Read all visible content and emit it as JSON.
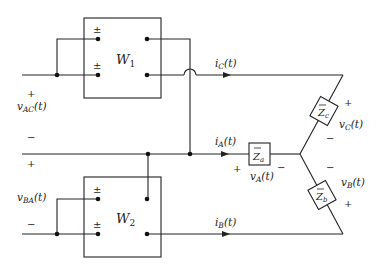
{
  "diagram": {
    "type": "circuit",
    "wattmeters": [
      {
        "id": "W1",
        "label": "W",
        "subscript": "1",
        "terminal_marks": [
          "±",
          "±"
        ]
      },
      {
        "id": "W2",
        "label": "W",
        "subscript": "2",
        "terminal_marks": [
          "±",
          "±"
        ]
      }
    ],
    "impedances": [
      {
        "id": "Za",
        "label": "Z",
        "subscript": "a"
      },
      {
        "id": "Zb",
        "label": "Z",
        "subscript": "b"
      },
      {
        "id": "Zc",
        "label": "Z",
        "subscript": "c"
      }
    ],
    "currents": [
      {
        "id": "iC",
        "label": "i",
        "subscript": "C",
        "arg": "(t)"
      },
      {
        "id": "iA",
        "label": "i",
        "subscript": "A",
        "arg": "(t)"
      },
      {
        "id": "iB",
        "label": "i",
        "subscript": "B",
        "arg": "(t)"
      }
    ],
    "voltages": [
      {
        "id": "vAC",
        "label": "v",
        "subscript": "AC",
        "arg": "(t)",
        "plus": "+",
        "minus": "−"
      },
      {
        "id": "vBA",
        "label": "v",
        "subscript": "BA",
        "arg": "(t)",
        "plus": "+",
        "minus": "−"
      },
      {
        "id": "vA",
        "label": "v",
        "subscript": "A",
        "arg": "(t)",
        "plus": "+",
        "minus": "−"
      },
      {
        "id": "vB",
        "label": "v",
        "subscript": "B",
        "arg": "(t)",
        "plus": "+",
        "minus": "−"
      },
      {
        "id": "vC",
        "label": "v",
        "subscript": "C",
        "arg": "(t)",
        "plus": "+",
        "minus": "−"
      }
    ]
  }
}
